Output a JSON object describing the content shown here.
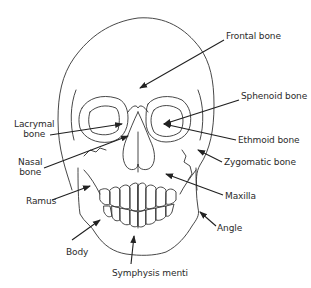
{
  "diagram": {
    "stroke_color": "#333333",
    "text_color": "#2a2a2a",
    "labels": [
      {
        "id": "frontal",
        "text": "Frontal bone",
        "x": 226,
        "y": 36
      },
      {
        "id": "sphenoid",
        "text": "Sphenoid bone",
        "x": 241,
        "y": 96
      },
      {
        "id": "lacrymal",
        "lines": [
          "Lacrymal",
          "bone"
        ],
        "x": 14,
        "y": 124
      },
      {
        "id": "ethmoid",
        "text": "Ethmoid bone",
        "x": 238,
        "y": 136
      },
      {
        "id": "nasal",
        "lines": [
          "Nasal",
          "bone"
        ],
        "x": 18,
        "y": 162
      },
      {
        "id": "zygomatic",
        "text": "Zygomatic bone",
        "x": 224,
        "y": 161
      },
      {
        "id": "ramus",
        "text": "Ramus",
        "x": 26,
        "y": 196
      },
      {
        "id": "maxilla",
        "text": "Maxilla",
        "x": 225,
        "y": 192
      },
      {
        "id": "angle",
        "text": "Angle",
        "x": 217,
        "y": 223
      },
      {
        "id": "body",
        "text": "Body",
        "x": 66,
        "y": 246
      },
      {
        "id": "symphysis",
        "text": "Symphysis menti",
        "x": 112,
        "y": 268
      }
    ]
  }
}
